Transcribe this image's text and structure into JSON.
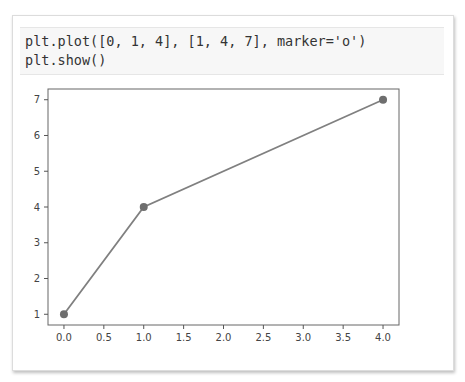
{
  "code_cell": {
    "lines": [
      "plt.plot([0, 1, 4], [1, 4, 7], marker='o')",
      "plt.show()"
    ]
  },
  "chart_data": {
    "type": "line",
    "title": "",
    "xlabel": "",
    "ylabel": "",
    "x": [
      0,
      1,
      4
    ],
    "series": [
      {
        "name": "",
        "values": [
          1,
          4,
          7
        ],
        "marker": "o",
        "color": "#808080"
      }
    ],
    "xlim": [
      -0.2,
      4.2
    ],
    "ylim": [
      0.7,
      7.3
    ],
    "xticks": [
      "0.0",
      "0.5",
      "1.0",
      "1.5",
      "2.0",
      "2.5",
      "3.0",
      "3.5",
      "4.0"
    ],
    "yticks": [
      "1",
      "2",
      "3",
      "4",
      "5",
      "6",
      "7"
    ],
    "grid": false,
    "legend": null
  }
}
